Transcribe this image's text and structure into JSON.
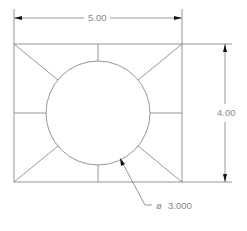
{
  "drawing": {
    "width_dim": "5.00",
    "height_dim": "4.00",
    "diameter_symbol": "ø",
    "diameter_value": "3.000",
    "line_color": "#8a8a8a",
    "arrow_color": "#111111"
  }
}
